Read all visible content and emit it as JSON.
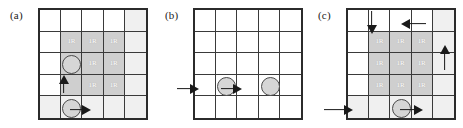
{
  "figure": {
    "width": 463,
    "height": 128,
    "background": "#ffffff",
    "grid_rows": 5,
    "grid_cols": 5,
    "cell_label_text": "1R",
    "colors": {
      "grid_border": "#2b2b2b",
      "grid_line": "#3a3a3a",
      "shade_dark": "#cfcfcf",
      "shade_mid": "#d9d9d9",
      "shade_faint": "#f0f0f0",
      "token_fill": "#d6d6d6",
      "token_stroke": "#4a4a4a",
      "arrow": "#1a1a1a",
      "label_text": "#ffffff"
    }
  },
  "panels": [
    {
      "id": "panel-a",
      "label": "(a)",
      "left": 0,
      "shaded_cells": [
        {
          "row": 2,
          "col": 2,
          "shade": "shade-dark",
          "label": "1R"
        },
        {
          "row": 2,
          "col": 3,
          "shade": "shade-dark",
          "label": "1R"
        },
        {
          "row": 2,
          "col": 4,
          "shade": "shade-dark",
          "label": "1R"
        },
        {
          "row": 3,
          "col": 2,
          "shade": "shade-dark",
          "label": ""
        },
        {
          "row": 3,
          "col": 3,
          "shade": "shade-dark",
          "label": "1R"
        },
        {
          "row": 3,
          "col": 4,
          "shade": "shade-dark",
          "label": "1R"
        },
        {
          "row": 4,
          "col": 2,
          "shade": "shade-dark",
          "label": ""
        },
        {
          "row": 4,
          "col": 3,
          "shade": "shade-dark",
          "label": "1R"
        },
        {
          "row": 4,
          "col": 4,
          "shade": "shade-dark",
          "label": "1R"
        },
        {
          "row": 1,
          "col": 5,
          "shade": "shade-faint",
          "label": ""
        },
        {
          "row": 2,
          "col": 5,
          "shade": "shade-faint",
          "label": ""
        },
        {
          "row": 3,
          "col": 5,
          "shade": "shade-faint",
          "label": ""
        },
        {
          "row": 4,
          "col": 5,
          "shade": "shade-faint",
          "label": ""
        },
        {
          "row": 5,
          "col": 1,
          "shade": "shade-faint",
          "label": ""
        },
        {
          "row": 5,
          "col": 2,
          "shade": "shade-faint",
          "label": ""
        },
        {
          "row": 5,
          "col": 3,
          "shade": "shade-faint",
          "label": ""
        },
        {
          "row": 5,
          "col": 4,
          "shade": "shade-faint",
          "label": ""
        },
        {
          "row": 5,
          "col": 5,
          "shade": "shade-faint",
          "label": ""
        }
      ],
      "tokens": [
        {
          "name": "robot-token-upper",
          "row": 3,
          "col": 2
        },
        {
          "name": "robot-token-lower",
          "row": 5,
          "col": 2
        }
      ],
      "arrows": [
        {
          "name": "arrow-up-col2",
          "dir": "up",
          "left": 58,
          "top": 76,
          "length": 17
        },
        {
          "name": "arrow-right-row5",
          "dir": "right",
          "left": 70,
          "top": 104,
          "length": 20
        }
      ]
    },
    {
      "id": "panel-b",
      "label": "(b)",
      "left": 155,
      "shaded_cells": [],
      "tokens": [
        {
          "name": "robot-token-left",
          "row": 4,
          "col": 2
        },
        {
          "name": "robot-token-right",
          "row": 4,
          "col": 4
        }
      ],
      "arrows": [
        {
          "name": "arrow-right-entry",
          "dir": "right",
          "left": 22,
          "top": 83,
          "length": 21
        },
        {
          "name": "arrow-right-between",
          "dir": "right",
          "left": 66,
          "top": 83,
          "length": 20
        }
      ]
    },
    {
      "id": "panel-c",
      "label": "(c)",
      "left": 308,
      "shaded_cells": [
        {
          "row": 2,
          "col": 2,
          "shade": "shade-dark",
          "label": "1R"
        },
        {
          "row": 2,
          "col": 3,
          "shade": "shade-dark",
          "label": "1R"
        },
        {
          "row": 2,
          "col": 4,
          "shade": "shade-dark",
          "label": "1R"
        },
        {
          "row": 3,
          "col": 2,
          "shade": "shade-dark",
          "label": "1R"
        },
        {
          "row": 3,
          "col": 3,
          "shade": "shade-dark",
          "label": "1R"
        },
        {
          "row": 3,
          "col": 4,
          "shade": "shade-dark",
          "label": "1R"
        },
        {
          "row": 4,
          "col": 2,
          "shade": "shade-dark",
          "label": "1R"
        },
        {
          "row": 4,
          "col": 3,
          "shade": "shade-dark",
          "label": "1R"
        },
        {
          "row": 4,
          "col": 4,
          "shade": "shade-dark",
          "label": "1R"
        },
        {
          "row": 1,
          "col": 5,
          "shade": "shade-faint",
          "label": ""
        },
        {
          "row": 2,
          "col": 5,
          "shade": "shade-faint",
          "label": ""
        },
        {
          "row": 3,
          "col": 5,
          "shade": "shade-faint",
          "label": ""
        },
        {
          "row": 4,
          "col": 5,
          "shade": "shade-faint",
          "label": ""
        },
        {
          "row": 5,
          "col": 1,
          "shade": "shade-faint",
          "label": ""
        },
        {
          "row": 5,
          "col": 2,
          "shade": "shade-faint",
          "label": ""
        },
        {
          "row": 5,
          "col": 3,
          "shade": "shade-faint",
          "label": ""
        },
        {
          "row": 5,
          "col": 4,
          "shade": "shade-faint",
          "label": ""
        },
        {
          "row": 5,
          "col": 5,
          "shade": "shade-faint",
          "label": ""
        }
      ],
      "tokens": [
        {
          "name": "robot-token-bottom",
          "row": 5,
          "col": 3
        }
      ],
      "arrows": [
        {
          "name": "arrow-down-col2",
          "dir": "down",
          "left": 58,
          "top": 11,
          "length": 22
        },
        {
          "name": "arrow-left-top",
          "dir": "left",
          "left": 94,
          "top": 18,
          "length": 24
        },
        {
          "name": "arrow-up-col5",
          "dir": "up",
          "left": 131,
          "top": 46,
          "length": 24
        },
        {
          "name": "arrow-right-entry",
          "dir": "right",
          "left": 16,
          "top": 104,
          "length": 28
        },
        {
          "name": "arrow-right-exit",
          "dir": "right",
          "left": 92,
          "top": 104,
          "length": 22
        }
      ]
    }
  ]
}
